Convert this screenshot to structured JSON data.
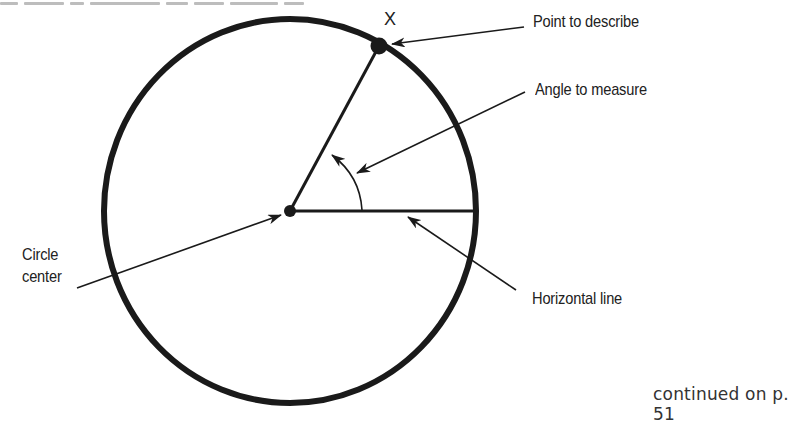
{
  "diagram": {
    "title_line_clipped": true,
    "point_label": "X",
    "labels": {
      "point": "Point to describe",
      "angle": "Angle to measure",
      "center_line1": "Circle",
      "center_line2": "center",
      "horizontal": "Horizontal line"
    },
    "footer": "continued on p. 51",
    "colors": {
      "ink": "#1a1a1a",
      "text": "#222222",
      "background": "#ffffff"
    },
    "geometry": {
      "circle_center": [
        290,
        211
      ],
      "circle_radius_x": 186,
      "circle_radius_y": 192,
      "point_x": [
        379,
        46
      ],
      "angle_degrees_approx": 63
    }
  }
}
